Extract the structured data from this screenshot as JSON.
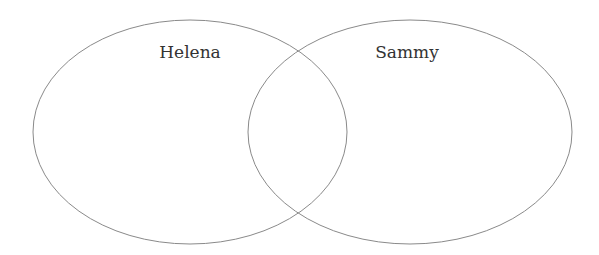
{
  "diagram": {
    "type": "venn",
    "sets": [
      {
        "label": "Helena",
        "cx": 190,
        "cy": 132,
        "rx": 157,
        "ry": 112
      },
      {
        "label": "Sammy",
        "cx": 410,
        "cy": 132,
        "rx": 162,
        "ry": 112
      }
    ],
    "stroke_color": "#8a8a8a",
    "background": "#ffffff"
  }
}
